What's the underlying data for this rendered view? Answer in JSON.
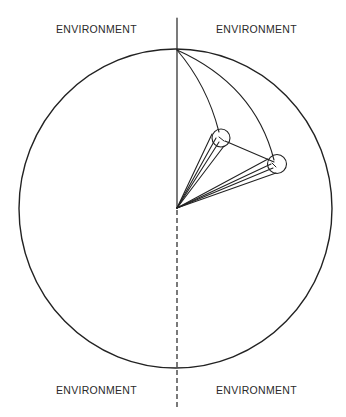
{
  "diagram": {
    "quadrant_labels": {
      "top_left": "ENVIRONMENT",
      "top_right": "ENVIRONMENT",
      "bottom_left": "ENVIRONMENT",
      "bottom_right": "ENVIRONMENT"
    },
    "colors": {
      "stroke": "#222222",
      "background": "#ffffff"
    }
  }
}
